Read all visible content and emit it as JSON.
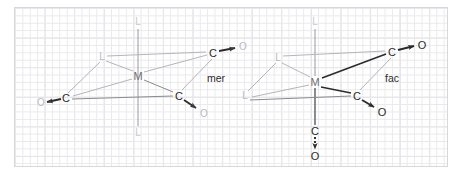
{
  "figure": {
    "background": "graph-paper-grid",
    "grid_color": "#dcdce1",
    "frame_color": "#d7d7dc"
  },
  "colors": {
    "bond_dark": "#2b2b2b",
    "bond_light": "#b5b5ba",
    "bond_mid": "#8a8a90",
    "atom_dark": "#2b2b2b",
    "atom_light": "#b9b9bd",
    "axis": "#9a9aa0"
  },
  "structures": [
    {
      "id": "mer",
      "isomer_label": "mer",
      "isomer_label_pos": {
        "x": 216,
        "y": 78
      },
      "metal": {
        "label": "M",
        "x": 138,
        "y": 76,
        "style": "dark"
      },
      "axis": {
        "top_label": "L",
        "top_pos": {
          "x": 138,
          "y": 22
        },
        "bottom_label": "L",
        "bottom_pos": {
          "x": 138,
          "y": 133
        }
      },
      "ligands": [
        {
          "label": "L",
          "x": 102,
          "y": 57,
          "style": "light"
        }
      ],
      "carbonyls": [
        {
          "carbon": "C",
          "cx": 66,
          "cy": 98,
          "oxygen": "O",
          "ox": 41,
          "oy": 103,
          "c_style": "dark",
          "o_style": "light",
          "bond": "arrow"
        },
        {
          "carbon": "C",
          "cx": 213,
          "cy": 53,
          "oxygen": "O",
          "ox": 243,
          "oy": 47,
          "c_style": "dark",
          "o_style": "light",
          "bond": "arrow"
        },
        {
          "carbon": "C",
          "cx": 179,
          "cy": 96,
          "oxygen": "O",
          "ox": 204,
          "oy": 114,
          "c_style": "dark",
          "o_style": "light",
          "bond": "arrow"
        }
      ]
    },
    {
      "id": "fac",
      "isomer_label": "fac",
      "isomer_label_pos": {
        "x": 392,
        "y": 78
      },
      "metal": {
        "label": "M",
        "x": 315,
        "y": 82,
        "style": "dark"
      },
      "axis": {
        "top_label": "L",
        "top_pos": {
          "x": 315,
          "y": 22
        },
        "bottom_label": null,
        "bottom_pos": null
      },
      "ligands": [
        {
          "label": "L",
          "x": 278,
          "y": 58,
          "style": "light"
        },
        {
          "label": "L",
          "x": 245,
          "y": 96,
          "style": "light"
        }
      ],
      "carbonyls": [
        {
          "carbon": "C",
          "cx": 392,
          "cy": 52,
          "oxygen": "O",
          "ox": 422,
          "oy": 45,
          "c_style": "dark",
          "o_style": "dark",
          "bond": "arrow"
        },
        {
          "carbon": "C",
          "cx": 357,
          "cy": 96,
          "oxygen": "O",
          "ox": 382,
          "oy": 112,
          "c_style": "dark",
          "o_style": "dark",
          "bond": "arrow"
        },
        {
          "carbon": "C",
          "cx": 315,
          "cy": 131,
          "oxygen": "O",
          "ox": 315,
          "oy": 156,
          "c_style": "dark",
          "o_style": "dark",
          "bond": "dotted-arrow"
        }
      ]
    }
  ],
  "legend": {
    "mer_meaning": "meridional",
    "fac_meaning": "facial"
  }
}
